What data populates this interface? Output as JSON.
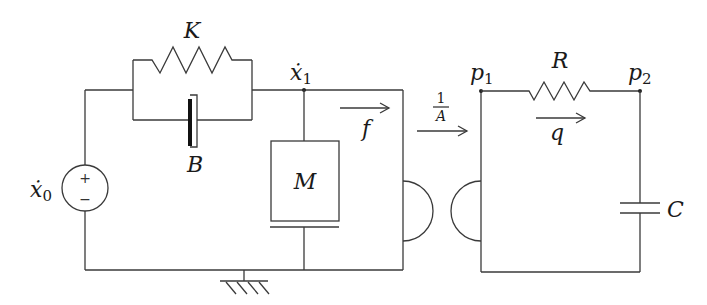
{
  "diagram": {
    "title": "",
    "mechanical_side": {
      "source": {
        "label": "ẋ",
        "subscript": "0",
        "plus": "+",
        "minus": "−"
      },
      "spring": {
        "label": "K"
      },
      "damper": {
        "label": "B"
      },
      "mass": {
        "label": "M"
      },
      "node": {
        "label": "ẋ",
        "subscript": "1"
      },
      "flow": {
        "label": "f"
      }
    },
    "transformer": {
      "ratio_numerator": "1",
      "ratio_denominator": "A"
    },
    "hydraulic_side": {
      "node1": {
        "label": "p",
        "subscript": "1"
      },
      "node2": {
        "label": "p",
        "subscript": "2"
      },
      "resistor": {
        "label": "R"
      },
      "capacitor": {
        "label": "C"
      },
      "flow": {
        "label": "q"
      }
    },
    "ground": {
      "symbol": "ground"
    },
    "colors": {
      "line": "#3a3a3a",
      "text": "#1a1a1a",
      "background": "#ffffff"
    }
  }
}
